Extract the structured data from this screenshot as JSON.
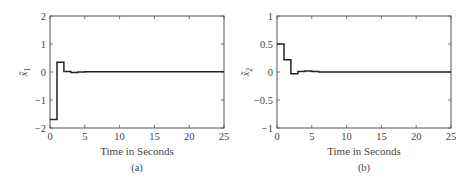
{
  "chart_data": [
    {
      "type": "line",
      "step": true,
      "panel": "a",
      "caption": "(a)",
      "title": "",
      "xlabel": "Time in Seconds",
      "ylabel": "x̃1",
      "ylabel_base": "x̃",
      "ylabel_sub": "1",
      "xlim": [
        0,
        25
      ],
      "ylim": [
        -2,
        2
      ],
      "xticks": [
        0,
        5,
        10,
        15,
        20,
        25
      ],
      "yticks": [
        -2,
        -1,
        0,
        1,
        2
      ],
      "xtick_labels": [
        "0",
        "5",
        "10",
        "15",
        "20",
        "25"
      ],
      "ytick_labels": [
        "−2",
        "−1",
        "0",
        "1",
        "2"
      ],
      "grid": false,
      "series": [
        {
          "name": "x̃1",
          "x": [
            0,
            1,
            1,
            2,
            2,
            3,
            3,
            4,
            4,
            5,
            5,
            25
          ],
          "y": [
            -1.7,
            -1.7,
            0.35,
            0.35,
            0.02,
            0.02,
            -0.02,
            -0.02,
            0.0,
            0.0,
            0.01,
            0.01
          ]
        }
      ]
    },
    {
      "type": "line",
      "step": true,
      "panel": "b",
      "caption": "(b)",
      "title": "",
      "xlabel": "Time in Seconds",
      "ylabel": "x̃2",
      "ylabel_base": "x̃",
      "ylabel_sub": "2",
      "xlim": [
        0,
        25
      ],
      "ylim": [
        -1,
        1
      ],
      "xticks": [
        0,
        5,
        10,
        15,
        20,
        25
      ],
      "yticks": [
        -1,
        -0.5,
        0,
        0.5,
        1
      ],
      "xtick_labels": [
        "0",
        "5",
        "10",
        "15",
        "20",
        "25"
      ],
      "ytick_labels": [
        "−1",
        "−0.5",
        "0",
        "0.5",
        "1"
      ],
      "grid": false,
      "series": [
        {
          "name": "x̃2",
          "x": [
            0,
            1,
            1,
            2,
            2,
            3,
            3,
            4,
            4,
            5,
            5,
            6,
            6,
            25
          ],
          "y": [
            0.5,
            0.5,
            0.22,
            0.22,
            -0.03,
            -0.03,
            0.01,
            0.01,
            0.02,
            0.02,
            0.01,
            0.01,
            0.0,
            0.0
          ]
        }
      ]
    }
  ]
}
